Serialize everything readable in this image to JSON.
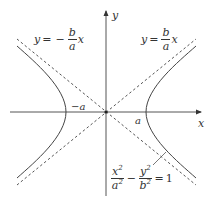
{
  "diagram": {
    "type": "hyperbola",
    "axes": {
      "x_label": "x",
      "y_label": "y",
      "origin_px": [
        106,
        112
      ]
    },
    "vertices": {
      "left_label": "−a",
      "right_label": "a"
    },
    "asymptotes": {
      "negative": {
        "lhs": "y",
        "eq": "=",
        "sign": "−",
        "num": "b",
        "den": "a",
        "var": "x"
      },
      "positive": {
        "lhs": "y",
        "eq": "=",
        "num": "b",
        "den": "a",
        "var": "x"
      }
    },
    "equation": {
      "term1_num": "x",
      "term1_num_exp": "2",
      "term1_den": "a",
      "term1_den_exp": "2",
      "minus": "−",
      "term2_num": "y",
      "term2_num_exp": "2",
      "term2_den": "b",
      "term2_den_exp": "2",
      "eq": "=",
      "rhs": "1"
    },
    "colors": {
      "curve": "#444444",
      "axis": "#555555",
      "asymptote": "#555555",
      "text": "#333333"
    }
  }
}
